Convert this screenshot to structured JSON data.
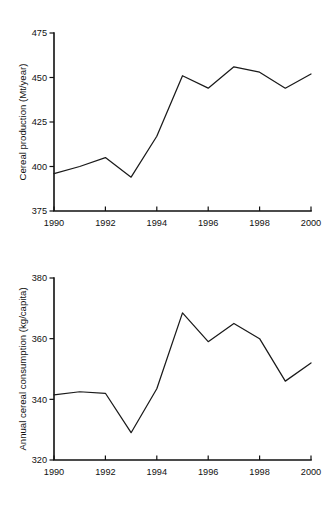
{
  "chart_data": [
    {
      "type": "line",
      "title": "",
      "name": "cereal-production",
      "xlabel": "",
      "ylabel": "Cereal production (Mt/year)",
      "x": [
        1990,
        1991,
        1992,
        1993,
        1994,
        1995,
        1996,
        1997,
        1998,
        1999,
        2000
      ],
      "values": [
        396,
        400,
        405,
        394,
        417,
        451,
        444,
        456,
        453,
        444,
        452
      ],
      "xlim": [
        1990,
        2000
      ],
      "ylim": [
        375,
        475
      ],
      "yticks": [
        375,
        400,
        425,
        450,
        475
      ],
      "ytick_labels": [
        "375",
        "400",
        "425",
        "450",
        "475"
      ],
      "xticks": [
        1990,
        1992,
        1994,
        1996,
        1998,
        2000
      ],
      "xtick_labels": [
        "1990",
        "1992",
        "1994",
        "1996",
        "1998",
        "2000"
      ],
      "grid": false,
      "legend": false,
      "line_color": "#1a1a1a"
    },
    {
      "type": "line",
      "title": "",
      "name": "cereal-consumption",
      "xlabel": "",
      "ylabel": "Annual cereal consumption (kg/capita)",
      "x": [
        1990,
        1991,
        1992,
        1993,
        1994,
        1995,
        1996,
        1997,
        1998,
        1999,
        2000
      ],
      "values": [
        341.5,
        342.5,
        342,
        329,
        343.5,
        368.5,
        359,
        365,
        360,
        346,
        352
      ],
      "xlim": [
        1990,
        2000
      ],
      "ylim": [
        320,
        380
      ],
      "yticks": [
        320,
        340,
        360,
        380
      ],
      "ytick_labels": [
        "320",
        "340",
        "360",
        "380"
      ],
      "xticks": [
        1990,
        1992,
        1994,
        1996,
        1998,
        2000
      ],
      "xtick_labels": [
        "1990",
        "1992",
        "1994",
        "1996",
        "1998",
        "2000"
      ],
      "grid": false,
      "legend": false,
      "line_color": "#1a1a1a"
    }
  ],
  "figures": {
    "production": {
      "ylabel": "Cereal production (Mt/year)",
      "ytick_labels": [
        "475",
        "450",
        "425",
        "400",
        "375"
      ],
      "xtick_labels": [
        "1990",
        "1992",
        "1994",
        "1996",
        "1998",
        "2000"
      ]
    },
    "consumption": {
      "ylabel": "Annual cereal consumption (kg/capita)",
      "ytick_labels": [
        "380",
        "360",
        "340",
        "320"
      ],
      "xtick_labels": [
        "1990",
        "1992",
        "1994",
        "1996",
        "1998",
        "2000"
      ]
    }
  }
}
